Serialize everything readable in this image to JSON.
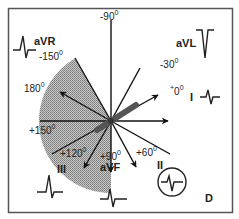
{
  "figure": {
    "panel_label": "D",
    "frame_color": "#555555",
    "hatch_color": "#9a9a9a",
    "axis_color": "#111111",
    "axis_band_color": "#555555"
  },
  "angles": {
    "minus90": "-90",
    "minus150": "-150",
    "minus30": "-30",
    "deg180": "180",
    "deg0": "0",
    "plus0_sign": "+",
    "plus150": "+150",
    "plus120": "+120",
    "plus90": "+90",
    "plus60": "+60",
    "degree_symbol": "0"
  },
  "leads": {
    "aVR": "aVR",
    "aVL": "aVL",
    "I": "I",
    "II": "II",
    "III": "III",
    "aVF": "aVF"
  },
  "shaded_region": {
    "from_deg": -120,
    "to_deg": 90,
    "description": "hatched sector (right-axis-deviation / extreme axis region)"
  },
  "axis_lines_deg": [
    -120,
    -90,
    -60,
    -30,
    0,
    30,
    60,
    90,
    120,
    150,
    180,
    -150
  ],
  "arrows_deg": [
    -150,
    -30,
    0,
    60,
    90,
    120
  ],
  "mean_axis_band_deg": -30
}
